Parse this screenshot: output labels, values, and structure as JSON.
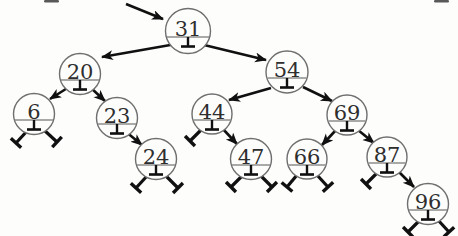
{
  "diagram": {
    "background": "#fdfdfc",
    "colors": {
      "circle_stroke": "#6f6f6f",
      "chord_line": "#8d8d8d",
      "value_text": "#2e2e2e",
      "arrow": "#101010",
      "null_marker": "#101010",
      "scan_artifact": "#3c3c3c"
    },
    "structure": {
      "root": "31",
      "children": {
        "31": [
          "20",
          "54"
        ],
        "20": [
          "6",
          "23"
        ],
        "23": [
          null,
          "24"
        ],
        "54": [
          "44",
          "69"
        ],
        "44": [
          null,
          "47"
        ],
        "69": [
          "66",
          "87"
        ],
        "87": [
          null,
          "96"
        ],
        "6": [
          null,
          null
        ],
        "24": [
          null,
          null
        ],
        "47": [
          null,
          null
        ],
        "66": [
          null,
          null
        ],
        "96": [
          null,
          null
        ]
      }
    },
    "nodes": [
      {
        "value": "31",
        "x": 188,
        "y": 31,
        "r": 22.5
      },
      {
        "value": "20",
        "x": 80,
        "y": 74,
        "r": 20.5
      },
      {
        "value": "54",
        "x": 287,
        "y": 72,
        "r": 21
      },
      {
        "value": "6",
        "x": 34,
        "y": 114,
        "r": 20.5
      },
      {
        "value": "23",
        "x": 117,
        "y": 118,
        "r": 20.5
      },
      {
        "value": "44",
        "x": 212,
        "y": 114,
        "r": 20
      },
      {
        "value": "69",
        "x": 347,
        "y": 115,
        "r": 20
      },
      {
        "value": "24",
        "x": 156,
        "y": 159,
        "r": 20.5
      },
      {
        "value": "47",
        "x": 251,
        "y": 159,
        "r": 20.5
      },
      {
        "value": "66",
        "x": 307,
        "y": 159,
        "r": 20
      },
      {
        "value": "87",
        "x": 387,
        "y": 157,
        "r": 20
      },
      {
        "value": "96",
        "x": 428,
        "y": 204,
        "r": 20.5
      }
    ],
    "edges": [
      {
        "from": "entry",
        "to": "31",
        "x1": 126,
        "y1": 4,
        "x2": 163,
        "y2": 19
      },
      {
        "from": "31",
        "to": "20",
        "x1": 176,
        "y1": 44,
        "x2": 102,
        "y2": 57
      },
      {
        "from": "31",
        "to": "54",
        "x1": 200,
        "y1": 44,
        "x2": 266,
        "y2": 60
      },
      {
        "from": "20",
        "to": "6",
        "x1": 69,
        "y1": 87,
        "x2": 50,
        "y2": 99
      },
      {
        "from": "20",
        "to": "23",
        "x1": 91,
        "y1": 88,
        "x2": 105,
        "y2": 101
      },
      {
        "from": "23",
        "to": "24",
        "x1": 125,
        "y1": 131,
        "x2": 142,
        "y2": 145
      },
      {
        "from": "54",
        "to": "44",
        "x1": 271,
        "y1": 88,
        "x2": 229,
        "y2": 100
      },
      {
        "from": "54",
        "to": "69",
        "x1": 303,
        "y1": 87,
        "x2": 332,
        "y2": 101
      },
      {
        "from": "44",
        "to": "47",
        "x1": 222,
        "y1": 128,
        "x2": 237,
        "y2": 144
      },
      {
        "from": "69",
        "to": "66",
        "x1": 336,
        "y1": 130,
        "x2": 322,
        "y2": 145
      },
      {
        "from": "69",
        "to": "87",
        "x1": 358,
        "y1": 130,
        "x2": 374,
        "y2": 143
      },
      {
        "from": "87",
        "to": "96",
        "x1": 398,
        "y1": 171,
        "x2": 414,
        "y2": 187
      }
    ],
    "null_pointers": [
      {
        "node": "6",
        "side": "left",
        "x1": 28,
        "y1": 130,
        "x2": 16,
        "y2": 143
      },
      {
        "node": "6",
        "side": "right",
        "x1": 44,
        "y1": 130,
        "x2": 57,
        "y2": 142
      },
      {
        "node": "24",
        "side": "left",
        "x1": 147,
        "y1": 176,
        "x2": 136,
        "y2": 188
      },
      {
        "node": "24",
        "side": "right",
        "x1": 166,
        "y1": 176,
        "x2": 178,
        "y2": 188
      },
      {
        "node": "44",
        "side": "left",
        "x1": 201,
        "y1": 130,
        "x2": 190,
        "y2": 141
      },
      {
        "node": "47",
        "side": "left",
        "x1": 242,
        "y1": 176,
        "x2": 231,
        "y2": 187
      },
      {
        "node": "47",
        "side": "right",
        "x1": 261,
        "y1": 176,
        "x2": 272,
        "y2": 187
      },
      {
        "node": "66",
        "side": "left",
        "x1": 297,
        "y1": 175,
        "x2": 287,
        "y2": 187
      },
      {
        "node": "66",
        "side": "right",
        "x1": 317,
        "y1": 175,
        "x2": 328,
        "y2": 187
      },
      {
        "node": "87",
        "side": "left",
        "x1": 377,
        "y1": 173,
        "x2": 366,
        "y2": 184
      },
      {
        "node": "96",
        "side": "left",
        "x1": 419,
        "y1": 221,
        "x2": 408,
        "y2": 232
      },
      {
        "node": "96",
        "side": "right",
        "x1": 438,
        "y1": 220,
        "x2": 449,
        "y2": 232
      }
    ],
    "scan_artifacts": [
      {
        "x": 44,
        "y": 0,
        "w": 15,
        "h": 2.5
      },
      {
        "x": 434,
        "y": 0,
        "w": 15,
        "h": 2.5
      }
    ],
    "geometry": {
      "chord_offset": 6,
      "stem_length": 9.5,
      "cap_half_width": 7,
      "null_cap_half": 7,
      "value_font_size": 21
    }
  }
}
